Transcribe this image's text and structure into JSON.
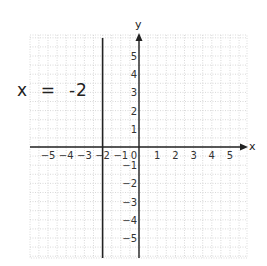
{
  "chart_data": {
    "type": "line",
    "title": "",
    "annotation": "x  =  -2",
    "xlabel": "x",
    "ylabel": "y",
    "xlim": [
      -5.8,
      5.8
    ],
    "ylim": [
      -5.8,
      5.8
    ],
    "grid": true,
    "x_ticks": [
      "-5",
      "-4",
      "-3",
      "-2",
      "-1",
      "0",
      "1",
      "2",
      "3",
      "4",
      "5"
    ],
    "y_ticks": [
      "5",
      "4",
      "3",
      "2",
      "1",
      "-1",
      "-2",
      "-3",
      "-4",
      "-5"
    ],
    "series": [
      {
        "name": "x = -2",
        "type": "vertical-line",
        "x": -2,
        "y_range": [
          -5.8,
          5.8
        ]
      }
    ]
  },
  "labels": {
    "equation": "x  =  -2",
    "x_axis": "x",
    "y_axis": "y"
  }
}
